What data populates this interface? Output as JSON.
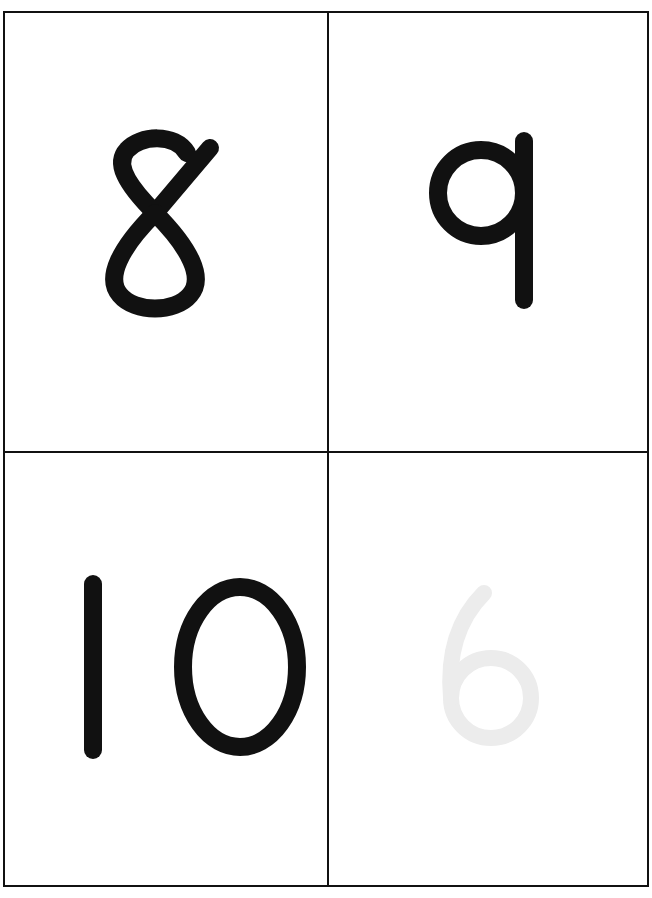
{
  "cards": [
    {
      "position": "top-left",
      "value": "8",
      "color": "#111111"
    },
    {
      "position": "top-right",
      "value": "9",
      "color": "#111111"
    },
    {
      "position": "bottom-left",
      "value": "10",
      "color": "#111111"
    },
    {
      "position": "bottom-right",
      "value": "6",
      "color": "#f2f2f2",
      "note": "faint show-through from reverse side"
    }
  ]
}
